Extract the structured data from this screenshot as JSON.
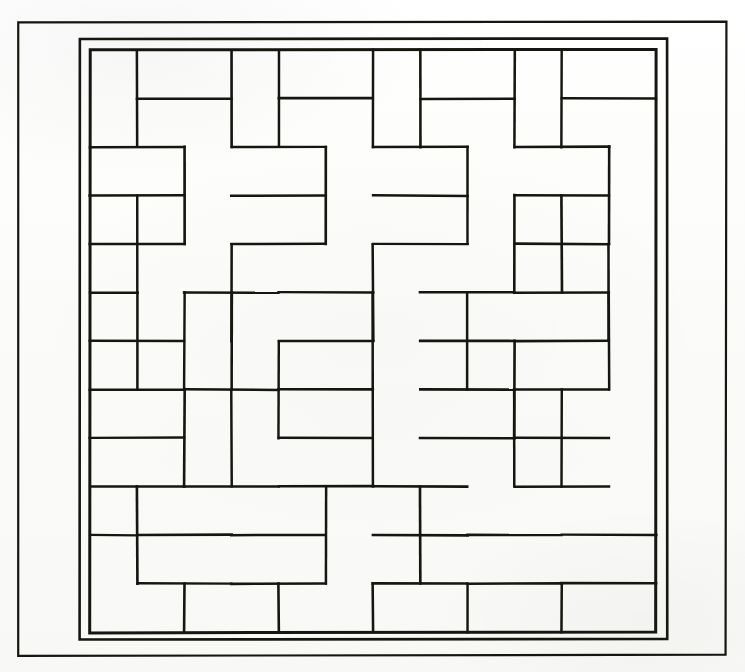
{
  "figure": {
    "title": "Brick tiling pattern figure",
    "kind": "line-drawing",
    "colors": {
      "ink": "#16150f",
      "paper": "#fdfdfc",
      "paper_shade": "#f8f8f6"
    },
    "canvas": {
      "width": 745,
      "height": 672
    }
  },
  "frames": [
    {
      "name": "outer-page-border",
      "x": 18,
      "y": 22,
      "width": 708,
      "height": 633,
      "stroke_width": 2.2
    },
    {
      "name": "middle-border",
      "x": 80,
      "y": 39,
      "width": 587,
      "height": 600,
      "stroke_width": 2.6
    },
    {
      "name": "inner-grid-border",
      "x": 90,
      "y": 50,
      "width": 566,
      "height": 582,
      "stroke_width": 3.0
    }
  ],
  "grid": {
    "origin_x": 90,
    "origin_y": 50,
    "cell_width": 47.17,
    "cell_height": 48.5,
    "cols": 12,
    "rows": 12,
    "stroke_width": 2.4,
    "brick_long_side_cells": 2,
    "brick_short_side_cells": 1,
    "total_bricks": 72
  },
  "chart_data": {
    "type": "table",
    "xlabel": "column index (0-11)",
    "ylabel": "row index (0-11)",
    "legend": [],
    "columns": [
      "col",
      "row",
      "orientation",
      "width_cells",
      "height_cells"
    ],
    "bricks": [
      [
        0,
        0,
        "v"
      ],
      [
        1,
        0,
        "h"
      ],
      [
        3,
        0,
        "v"
      ],
      [
        4,
        0,
        "h"
      ],
      [
        6,
        0,
        "v"
      ],
      [
        7,
        0,
        "h"
      ],
      [
        9,
        0,
        "v"
      ],
      [
        10,
        0,
        "h"
      ],
      [
        1,
        1,
        "h"
      ],
      [
        4,
        1,
        "h"
      ],
      [
        7,
        1,
        "h"
      ],
      [
        10,
        1,
        "h"
      ],
      [
        0,
        2,
        "h"
      ],
      [
        2,
        2,
        "v"
      ],
      [
        3,
        2,
        "h"
      ],
      [
        5,
        2,
        "v"
      ],
      [
        6,
        2,
        "h"
      ],
      [
        8,
        2,
        "v"
      ],
      [
        9,
        2,
        "h"
      ],
      [
        11,
        2,
        "v"
      ],
      [
        0,
        3,
        "v"
      ],
      [
        1,
        3,
        "v"
      ],
      [
        3,
        3,
        "h"
      ],
      [
        6,
        3,
        "h"
      ],
      [
        9,
        3,
        "v"
      ],
      [
        10,
        3,
        "v"
      ],
      [
        3,
        4,
        "v"
      ],
      [
        4,
        4,
        "h"
      ],
      [
        6,
        4,
        "v"
      ],
      [
        7,
        4,
        "h"
      ],
      [
        9,
        4,
        "h"
      ],
      [
        11,
        4,
        "v"
      ],
      [
        0,
        4,
        "h"
      ],
      [
        4,
        5,
        "h"
      ],
      [
        7,
        5,
        "h"
      ],
      [
        9,
        5,
        "h"
      ],
      [
        0,
        5,
        "v"
      ],
      [
        1,
        5,
        "v"
      ],
      [
        2,
        5,
        "v"
      ],
      [
        3,
        5,
        "v"
      ],
      [
        6,
        5,
        "v"
      ],
      [
        8,
        5,
        "v"
      ],
      [
        11,
        5,
        "v"
      ],
      [
        0,
        6,
        "h"
      ],
      [
        4,
        6,
        "h"
      ],
      [
        9,
        6,
        "h"
      ],
      [
        0,
        7,
        "h"
      ],
      [
        2,
        7,
        "v"
      ],
      [
        3,
        7,
        "v"
      ],
      [
        4,
        7,
        "h"
      ],
      [
        6,
        7,
        "v"
      ],
      [
        7,
        7,
        "h"
      ],
      [
        9,
        7,
        "v"
      ],
      [
        10,
        7,
        "v"
      ],
      [
        0,
        8,
        "h"
      ],
      [
        4,
        8,
        "h"
      ],
      [
        7,
        8,
        "h"
      ],
      [
        0,
        9,
        "v"
      ],
      [
        1,
        9,
        "h"
      ],
      [
        3,
        9,
        "h"
      ],
      [
        5,
        9,
        "v"
      ],
      [
        6,
        9,
        "h"
      ],
      [
        8,
        9,
        "h"
      ],
      [
        10,
        9,
        "h"
      ],
      [
        1,
        10,
        "h"
      ],
      [
        3,
        10,
        "h"
      ],
      [
        6,
        10,
        "h"
      ],
      [
        8,
        10,
        "h"
      ],
      [
        10,
        10,
        "h"
      ],
      [
        0,
        11,
        "h"
      ],
      [
        2,
        11,
        "h"
      ],
      [
        4,
        11,
        "h"
      ],
      [
        6,
        11,
        "h"
      ],
      [
        8,
        11,
        "h"
      ],
      [
        10,
        11,
        "h"
      ]
    ],
    "grid_lines": {
      "vertical_x": [
        90,
        137,
        184,
        232,
        279,
        326,
        373,
        420,
        467,
        515,
        562,
        609,
        656
      ],
      "horizontal_y": [
        50,
        99,
        147,
        196,
        244,
        293,
        341,
        390,
        438,
        487,
        535,
        584,
        632
      ]
    }
  },
  "segments": {
    "horizontal": [
      [
        1,
        1,
        3
      ],
      [
        4,
        1,
        6
      ],
      [
        7,
        1,
        9
      ],
      [
        10,
        1,
        12
      ],
      [
        0,
        2,
        2
      ],
      [
        3,
        2,
        5
      ],
      [
        6,
        2,
        8
      ],
      [
        9,
        2,
        11
      ],
      [
        0,
        3,
        2
      ],
      [
        3,
        3,
        5
      ],
      [
        6,
        3,
        8
      ],
      [
        9,
        3,
        11
      ],
      [
        0,
        4,
        2
      ],
      [
        3,
        4,
        5
      ],
      [
        6,
        4,
        8
      ],
      [
        9,
        4,
        11
      ],
      [
        0,
        5,
        1
      ],
      [
        2,
        5,
        4
      ],
      [
        4,
        5,
        6
      ],
      [
        7,
        5,
        9
      ],
      [
        9,
        5,
        11
      ],
      [
        0,
        6,
        2
      ],
      [
        4,
        6,
        6
      ],
      [
        7,
        6,
        9
      ],
      [
        9,
        6,
        11
      ],
      [
        0,
        7,
        2
      ],
      [
        2,
        7,
        4
      ],
      [
        4,
        7,
        6
      ],
      [
        7,
        7,
        9
      ],
      [
        9,
        7,
        11
      ],
      [
        0,
        8,
        2
      ],
      [
        4,
        8,
        6
      ],
      [
        7,
        8,
        9
      ],
      [
        9,
        8,
        11
      ],
      [
        0,
        9,
        2
      ],
      [
        2,
        9,
        4
      ],
      [
        4,
        9,
        6
      ],
      [
        6,
        9,
        8
      ],
      [
        9,
        9,
        11
      ],
      [
        0,
        10,
        1
      ],
      [
        1,
        10,
        3
      ],
      [
        3,
        10,
        5
      ],
      [
        6,
        10,
        8
      ],
      [
        8,
        10,
        10
      ],
      [
        10,
        10,
        12
      ],
      [
        1,
        11,
        3
      ],
      [
        3,
        11,
        5
      ],
      [
        6,
        11,
        8
      ],
      [
        8,
        11,
        10
      ],
      [
        10,
        11,
        12
      ]
    ],
    "vertical": [
      [
        1,
        0,
        2
      ],
      [
        3,
        0,
        2
      ],
      [
        4,
        0,
        2
      ],
      [
        6,
        0,
        2
      ],
      [
        7,
        0,
        2
      ],
      [
        9,
        0,
        2
      ],
      [
        10,
        0,
        2
      ],
      [
        2,
        2,
        4
      ],
      [
        5,
        2,
        4
      ],
      [
        8,
        2,
        4
      ],
      [
        11,
        2,
        4
      ],
      [
        1,
        3,
        5
      ],
      [
        3,
        4,
        6
      ],
      [
        6,
        4,
        6
      ],
      [
        9,
        3,
        5
      ],
      [
        10,
        3,
        5
      ],
      [
        11,
        4,
        6
      ],
      [
        2,
        5,
        7
      ],
      [
        3,
        5,
        7
      ],
      [
        6,
        5,
        7
      ],
      [
        8,
        5,
        7
      ],
      [
        11,
        5,
        7
      ],
      [
        1,
        5,
        7
      ],
      [
        4,
        6,
        8
      ],
      [
        9,
        6,
        8
      ],
      [
        2,
        7,
        9
      ],
      [
        3,
        7,
        9
      ],
      [
        6,
        7,
        9
      ],
      [
        9,
        7,
        9
      ],
      [
        10,
        7,
        9
      ],
      [
        1,
        9,
        11
      ],
      [
        5,
        9,
        11
      ],
      [
        7,
        9,
        11
      ],
      [
        2,
        11,
        12
      ],
      [
        4,
        11,
        12
      ],
      [
        6,
        11,
        12
      ],
      [
        8,
        11,
        12
      ],
      [
        10,
        11,
        12
      ]
    ]
  }
}
